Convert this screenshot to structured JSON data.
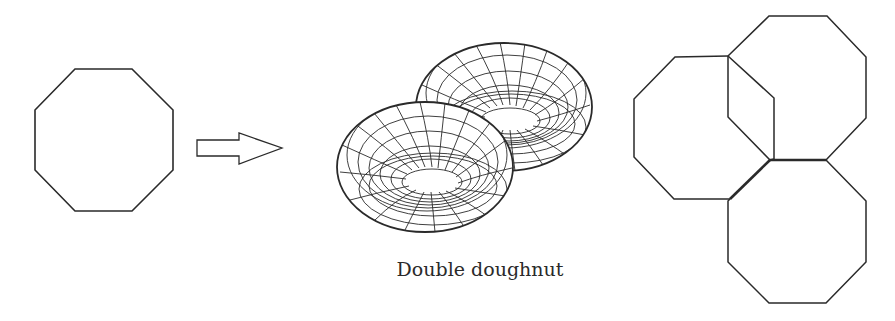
{
  "figure": {
    "caption": "Double doughnut",
    "stroke_color": "#2a2a2a",
    "background": "#ffffff",
    "panels": [
      {
        "name": "octagon",
        "description": "Single regular octagon"
      },
      {
        "name": "arrow",
        "description": "Hollow right-pointing arrow"
      },
      {
        "name": "double-doughnut",
        "description": "Wireframe genus-2 surface (two joined tori)"
      },
      {
        "name": "octagon-gluing",
        "description": "Three overlapping octagons with thicker shared edges"
      }
    ]
  }
}
